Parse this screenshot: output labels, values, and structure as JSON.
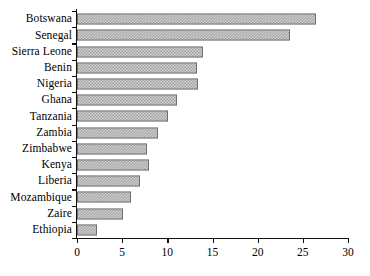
{
  "chart_data": {
    "type": "bar",
    "orientation": "horizontal",
    "title": "",
    "xlabel": "",
    "ylabel": "",
    "xlim": [
      0,
      30
    ],
    "xticks": [
      0,
      5,
      10,
      15,
      20,
      25,
      30
    ],
    "xtick_labels": [
      "0",
      "5",
      "10",
      "15",
      "20",
      "25",
      "30"
    ],
    "grid": false,
    "legend": false,
    "categories": [
      "Botswana",
      "Senegal",
      "Sierra Leone",
      "Benin",
      "Nigeria",
      "Ghana",
      "Tanzania",
      "Zambia",
      "Zimbabwe",
      "Kenya",
      "Liberia",
      "Mozambique",
      "Zaire",
      "Ethiopia"
    ],
    "values": [
      26.5,
      23.6,
      14.0,
      13.3,
      13.4,
      11.1,
      10.1,
      9.0,
      7.8,
      8.0,
      7.0,
      6.0,
      5.1,
      2.2
    ],
    "bar_style": {
      "fill": "#cfcfcf",
      "hatch": "cross-dot",
      "hatch_color": "#9a9a9a",
      "edge": "#6f6f6f"
    }
  },
  "axes": {
    "axis_color": "#111111"
  }
}
